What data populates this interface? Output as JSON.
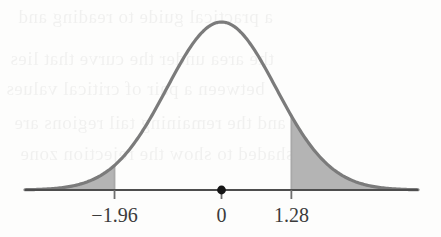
{
  "figure": {
    "kind": "normal-distribution-curve",
    "background_color": "#fdfdfc",
    "curve_color": "#7b7b7b",
    "curve_width": 3.2,
    "shade_color": "#b4b4b4",
    "axis_color": "#4d4d4d",
    "boundary_line_color": "#a8a8a8",
    "center_dot_color": "#151515",
    "tick_color": "#6e6e6e",
    "label_color": "#3b3b3b"
  },
  "axis": {
    "x_start_px": 25,
    "x_end_px": 418,
    "baseline_y_px": 190,
    "tick_length_px": 9
  },
  "labels": {
    "left_critical": "−1.96",
    "center": "0",
    "right_critical": "1.28"
  },
  "bleed_text": {
    "opacity": 0.055,
    "lines": [
      {
        "text": "a practical guide to reading and",
        "x": 18,
        "y": 6,
        "size": 19
      },
      {
        "text": "the area under the curve that lies",
        "x": 10,
        "y": 48,
        "size": 19
      },
      {
        "text": "between a pair of critical values",
        "x": 6,
        "y": 78,
        "size": 19
      },
      {
        "text": "and the remaining tail regions are",
        "x": 14,
        "y": 112,
        "size": 19
      },
      {
        "text": "shaded to show the rejection zone",
        "x": 20,
        "y": 143,
        "size": 19
      }
    ]
  },
  "chart_data": {
    "type": "line",
    "title": "",
    "xlabel": "",
    "ylabel": "",
    "distribution": "standard normal",
    "mean": 0,
    "sd": 1,
    "xlim": [
      -3.6,
      3.6
    ],
    "ylim": [
      0,
      0.42
    ],
    "grid": false,
    "legend": null,
    "tick_values": [
      -1.96,
      0,
      1.28
    ],
    "tick_labels": [
      "−1.96",
      "0",
      "1.28"
    ],
    "annotations": [
      {
        "name": "center-dot",
        "x": 0,
        "y": 0,
        "style": "filled-dot"
      }
    ],
    "shaded_regions": [
      {
        "name": "left-tail",
        "from": -3.6,
        "to": -1.96,
        "area": 0.025,
        "fill": "#b4b4b4"
      },
      {
        "name": "right-tail",
        "from": 1.28,
        "to": 3.6,
        "area": 0.1003,
        "fill": "#b4b4b4"
      }
    ],
    "boundary_lines": [
      {
        "name": "left-boundary",
        "x": -1.96,
        "height_density": 0.0584
      },
      {
        "name": "right-boundary",
        "x": 1.28,
        "height_density": 0.1758
      }
    ],
    "x": [
      -3.6,
      -3.4,
      -3.2,
      -3.0,
      -2.8,
      -2.6,
      -2.4,
      -2.2,
      -2.0,
      -1.96,
      -1.8,
      -1.6,
      -1.4,
      -1.2,
      -1.0,
      -0.8,
      -0.6,
      -0.4,
      -0.2,
      0.0,
      0.2,
      0.4,
      0.6,
      0.8,
      1.0,
      1.2,
      1.28,
      1.4,
      1.6,
      1.8,
      2.0,
      2.2,
      2.4,
      2.6,
      2.8,
      3.0,
      3.2,
      3.4,
      3.6
    ],
    "y": [
      0.0006,
      0.0012,
      0.0024,
      0.0044,
      0.0079,
      0.0136,
      0.0224,
      0.0355,
      0.054,
      0.0584,
      0.079,
      0.1109,
      0.1497,
      0.1942,
      0.242,
      0.2897,
      0.3332,
      0.3683,
      0.391,
      0.3989,
      0.391,
      0.3683,
      0.3332,
      0.2897,
      0.242,
      0.1942,
      0.1758,
      0.1497,
      0.1109,
      0.079,
      0.054,
      0.0355,
      0.0224,
      0.0136,
      0.0079,
      0.0044,
      0.0024,
      0.0012,
      0.0006
    ]
  }
}
